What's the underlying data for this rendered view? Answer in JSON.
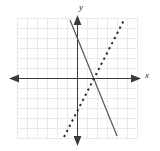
{
  "figure": {
    "title": "",
    "background_color": "#ffffff",
    "width": 160,
    "height": 151
  },
  "axes": {
    "x_label": "x",
    "y_label": "y",
    "axis_color": "#3a3a3a",
    "origin_px": {
      "x": 77,
      "y": 78
    },
    "x_axis_px": {
      "x_start": 10,
      "x_end": 141,
      "y": 78
    },
    "y_axis_px": {
      "x": 77,
      "y_start": 17,
      "y_end": 145
    },
    "arrowheads": [
      "left",
      "right",
      "up",
      "down"
    ]
  },
  "grid": {
    "visible": true,
    "color": "#e9e9ed",
    "spacing_px": 10,
    "x_min_px": 17,
    "x_max_px": 137,
    "y_min_px": 18,
    "y_max_px": 138,
    "columns": 12,
    "rows": 12
  },
  "chart_data": {
    "type": "line",
    "title": "",
    "xlabel": "x",
    "ylabel": "y",
    "grid": true,
    "legend_position": "none",
    "xlim": [
      -6,
      6
    ],
    "ylim": [
      -6,
      6
    ],
    "xticks": [
      -6,
      -5,
      -4,
      -3,
      -2,
      -1,
      0,
      1,
      2,
      3,
      4,
      5,
      6
    ],
    "yticks": [
      -6,
      -5,
      -4,
      -3,
      -2,
      -1,
      0,
      1,
      2,
      3,
      4,
      5,
      6
    ],
    "tick_labels_shown": false,
    "series": [
      {
        "name": "solid-line",
        "style": "solid",
        "color": "#555555",
        "slope": -2.5,
        "y_intercept": 2.5,
        "equation": "y = -2.5x + 2.5",
        "x": [
          -0.7,
          4.0
        ],
        "y": [
          4.25,
          -5.75
        ],
        "endpoints_px": [
          {
            "x": 70,
            "y": 20
          },
          {
            "x": 117,
            "y": 136
          }
        ]
      },
      {
        "name": "dashed-line",
        "style": "dashed",
        "color": "#2b2b2b",
        "slope": 1.95,
        "y_intercept": -2.0,
        "equation": "y = 1.95x - 2",
        "x": [
          -1.3,
          4.7
        ],
        "y": [
          -5.9,
          5.8
        ],
        "endpoints_px": [
          {
            "x": 64,
            "y": 137
          },
          {
            "x": 124,
            "y": 20
          }
        ]
      }
    ],
    "intersection": {
      "x": 1.0,
      "y": 0.0,
      "px": {
        "x": 87,
        "y": 80
      }
    }
  }
}
